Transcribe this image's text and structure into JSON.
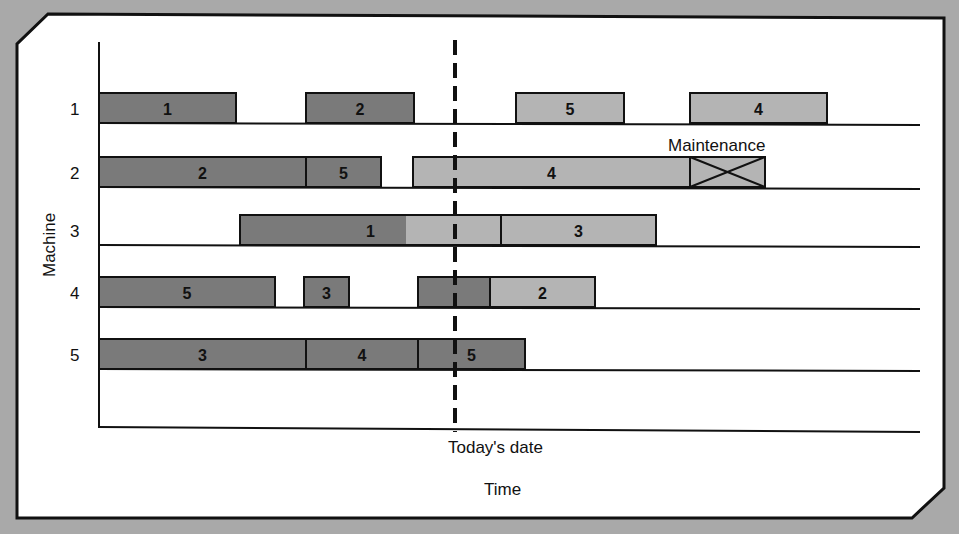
{
  "chart_data": {
    "type": "gantt",
    "title": "",
    "xlabel": "Time",
    "ylabel": "Machine",
    "marker": {
      "label": "Today's date",
      "x": 455,
      "style": "dashed"
    },
    "colors": {
      "completed": "#7a7a7a",
      "scheduled": "#b4b4b4",
      "background": "#a9a9a9",
      "panel": "#ffffff",
      "line": "#111111"
    },
    "machines": [
      {
        "label": "1",
        "baseline": 123,
        "jobs": [
          {
            "job": "1",
            "start": 99,
            "end": 236,
            "status": "completed"
          },
          {
            "job": "2",
            "start": 306,
            "end": 414,
            "status": "completed"
          },
          {
            "job": "5",
            "start": 516,
            "end": 624,
            "status": "scheduled"
          },
          {
            "job": "4",
            "start": 690,
            "end": 827,
            "status": "scheduled"
          }
        ]
      },
      {
        "label": "2",
        "baseline": 187,
        "jobs": [
          {
            "job": "2",
            "start": 99,
            "end": 306,
            "status": "completed"
          },
          {
            "job": "5",
            "start": 306,
            "end": 381,
            "status": "completed"
          },
          {
            "job": "4",
            "start": 413,
            "end": 690,
            "status": "scheduled"
          },
          {
            "job": "",
            "start": 690,
            "end": 765,
            "status": "maintenance",
            "label": "Maintenance"
          }
        ]
      },
      {
        "label": "3",
        "baseline": 245,
        "jobs": [
          {
            "job": "1",
            "start": 240,
            "end": 501,
            "status": "split",
            "split_at": 406
          },
          {
            "job": "3",
            "start": 501,
            "end": 656,
            "status": "scheduled"
          }
        ]
      },
      {
        "label": "4",
        "baseline": 307,
        "jobs": [
          {
            "job": "5",
            "start": 99,
            "end": 275,
            "status": "completed"
          },
          {
            "job": "3",
            "start": 304,
            "end": 349,
            "status": "completed"
          },
          {
            "job": "",
            "start": 418,
            "end": 490,
            "status": "completed"
          },
          {
            "job": "2",
            "start": 490,
            "end": 595,
            "status": "scheduled"
          }
        ]
      },
      {
        "label": "5",
        "baseline": 369,
        "jobs": [
          {
            "job": "3",
            "start": 99,
            "end": 306,
            "status": "completed"
          },
          {
            "job": "4",
            "start": 306,
            "end": 418,
            "status": "completed"
          },
          {
            "job": "5",
            "start": 418,
            "end": 525,
            "status": "completed"
          }
        ]
      }
    ]
  },
  "labels": {
    "y_axis": "Machine",
    "x_axis": "Time",
    "today": "Today's date",
    "maintenance": "Maintenance",
    "rows": [
      "1",
      "2",
      "3",
      "4",
      "5"
    ]
  }
}
